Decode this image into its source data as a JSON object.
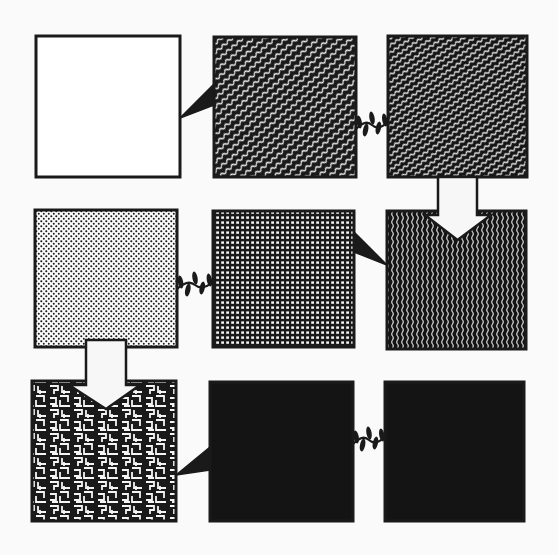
{
  "diagram": {
    "background": "#fafafa",
    "ink": "#1a1a1a",
    "paper": "#ffffff",
    "grid": {
      "rows": 3,
      "cols": 3
    },
    "panels": [
      {
        "id": "panel-1",
        "row": 0,
        "col": 0,
        "x": 36,
        "y": 36,
        "w": 144,
        "h": 141,
        "texture": "blank"
      },
      {
        "id": "panel-2",
        "row": 0,
        "col": 1,
        "x": 214,
        "y": 37,
        "w": 142,
        "h": 140,
        "texture": "diagonal-waves"
      },
      {
        "id": "panel-3",
        "row": 0,
        "col": 2,
        "x": 388,
        "y": 36,
        "w": 139,
        "h": 141,
        "texture": "diagonal-waves-dense"
      },
      {
        "id": "panel-4",
        "row": 1,
        "col": 0,
        "x": 35,
        "y": 210,
        "w": 142,
        "h": 137,
        "texture": "stipple-dots"
      },
      {
        "id": "panel-5",
        "row": 1,
        "col": 1,
        "x": 213,
        "y": 211,
        "w": 141,
        "h": 136,
        "texture": "fine-grid"
      },
      {
        "id": "panel-6",
        "row": 1,
        "col": 2,
        "x": 387,
        "y": 211,
        "w": 139,
        "h": 138,
        "texture": "vertical-waves"
      },
      {
        "id": "panel-7",
        "row": 2,
        "col": 0,
        "x": 32,
        "y": 381,
        "w": 144,
        "h": 140,
        "texture": "maze"
      },
      {
        "id": "panel-8",
        "row": 2,
        "col": 1,
        "x": 210,
        "y": 382,
        "w": 143,
        "h": 139,
        "texture": "solid"
      },
      {
        "id": "panel-9",
        "row": 2,
        "col": 2,
        "x": 385,
        "y": 382,
        "w": 139,
        "h": 139,
        "texture": "solid"
      }
    ],
    "connectors": [
      {
        "id": "wedge-1-2",
        "type": "speech-wedge",
        "from": "panel-1",
        "to": "panel-2",
        "points": [
          [
            180,
            118
          ],
          [
            214,
            84
          ],
          [
            214,
            105
          ]
        ]
      },
      {
        "id": "squiggle-2-3",
        "type": "squiggle",
        "from": "panel-2",
        "to": "panel-3",
        "x1": 356,
        "x2": 388,
        "y": 125
      },
      {
        "id": "arrow-3-6",
        "type": "down-arrow",
        "from": "panel-3",
        "to": "panel-6",
        "shaft_x1": 438,
        "shaft_x2": 477,
        "top": 177,
        "head_y": 215,
        "head_x1": 425,
        "head_x2": 491,
        "tip_y": 240
      },
      {
        "id": "squiggle-4-5",
        "type": "squiggle",
        "from": "panel-4",
        "to": "panel-5",
        "x1": 177,
        "x2": 213,
        "y": 285
      },
      {
        "id": "wedge-5-6",
        "type": "speech-wedge",
        "from": "panel-5",
        "to": "panel-6",
        "points": [
          [
            354,
            232
          ],
          [
            354,
            252
          ],
          [
            387,
            265
          ]
        ]
      },
      {
        "id": "arrow-4-7",
        "type": "down-arrow",
        "from": "panel-4",
        "to": "panel-7",
        "shaft_x1": 86,
        "shaft_x2": 126,
        "top": 340,
        "head_y": 385,
        "head_x1": 69,
        "head_x2": 140,
        "tip_y": 409
      },
      {
        "id": "wedge-7-8",
        "type": "speech-wedge",
        "from": "panel-7",
        "to": "panel-8",
        "points": [
          [
            176,
            475
          ],
          [
            210,
            447
          ],
          [
            210,
            470
          ]
        ]
      },
      {
        "id": "squiggle-8-9",
        "type": "squiggle",
        "from": "panel-8",
        "to": "panel-9",
        "x1": 353,
        "x2": 385,
        "y": 440
      }
    ]
  }
}
